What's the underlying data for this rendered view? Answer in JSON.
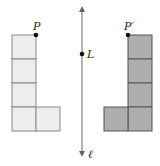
{
  "diagram": {
    "line": {
      "label": "ℓ",
      "x": 82,
      "y1": 9,
      "y2": 154,
      "color": "#666666"
    },
    "point_on_line": {
      "label": "L",
      "x": 82,
      "y": 54
    },
    "original": {
      "label": "P",
      "vertex": {
        "x": 36,
        "y": 35
      },
      "fill": "#eeeeee",
      "stroke": "#888888",
      "cells": [
        {
          "x": 12,
          "y": 35
        },
        {
          "x": 12,
          "y": 59
        },
        {
          "x": 12,
          "y": 83
        },
        {
          "x": 12,
          "y": 107
        },
        {
          "x": 36,
          "y": 107
        }
      ]
    },
    "image": {
      "label": "P′",
      "vertex": {
        "x": 128,
        "y": 35
      },
      "fill": "#aeaeae",
      "stroke": "#555555",
      "cells": [
        {
          "x": 128,
          "y": 35
        },
        {
          "x": 128,
          "y": 59
        },
        {
          "x": 128,
          "y": 83
        },
        {
          "x": 128,
          "y": 107
        },
        {
          "x": 104,
          "y": 107
        }
      ]
    },
    "cell_size": 24
  }
}
